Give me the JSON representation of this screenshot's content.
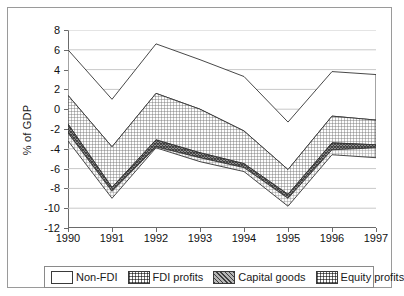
{
  "chart_data": {
    "type": "area",
    "title": "",
    "xlabel": "",
    "ylabel": "% of GDP",
    "categories": [
      "1990",
      "1991",
      "1992",
      "1993",
      "1994",
      "1995",
      "1996",
      "1997"
    ],
    "x": [
      1990,
      1991,
      1992,
      1993,
      1994,
      1995,
      1996,
      1997
    ],
    "ylim": [
      -12,
      8
    ],
    "yticks": [
      8,
      6,
      4,
      2,
      0,
      -2,
      -4,
      -6,
      -8,
      -10,
      -12
    ],
    "ytick_labels": [
      "8",
      "6",
      "4",
      "2",
      "0",
      "-2",
      "-4",
      "-6",
      "-8",
      "-10",
      "-12"
    ],
    "grid": true,
    "legend_position": "bottom",
    "stacked": true,
    "stack_order_top_to_bottom": [
      "Non-FDI",
      "FDI profits",
      "Capital goods",
      "Equity profits"
    ],
    "boundaries": {
      "description": "Cumulative band edges in % of GDP, top edge to bottom edge, per year",
      "non_fdi_top": [
        6.0,
        1.0,
        6.6,
        5.0,
        3.3,
        -1.3,
        3.8,
        3.5
      ],
      "fdi_profits_top": [
        1.4,
        -3.8,
        1.6,
        0.0,
        -2.2,
        -6.1,
        -0.7,
        -1.1
      ],
      "capital_goods_top": [
        -1.5,
        -7.9,
        -3.1,
        -4.4,
        -5.5,
        -8.6,
        -3.4,
        -3.6
      ],
      "equity_profits_top": [
        -2.4,
        -8.3,
        -3.8,
        -4.9,
        -5.9,
        -9.0,
        -4.1,
        -3.9
      ],
      "bottom": [
        -3.2,
        -9.0,
        -3.9,
        -5.3,
        -6.3,
        -9.8,
        -4.6,
        -4.9
      ]
    },
    "series": [
      {
        "name": "Non-FDI",
        "values": [
          4.6,
          4.8,
          5.0,
          5.0,
          5.5,
          4.8,
          4.5,
          4.6
        ]
      },
      {
        "name": "FDI profits",
        "values": [
          2.9,
          4.1,
          4.7,
          4.4,
          3.3,
          2.5,
          2.7,
          2.5
        ]
      },
      {
        "name": "Capital goods",
        "values": [
          0.9,
          0.4,
          0.7,
          0.5,
          0.4,
          0.4,
          0.7,
          0.3
        ]
      },
      {
        "name": "Equity profits",
        "values": [
          0.8,
          0.7,
          0.1,
          0.4,
          0.4,
          0.8,
          0.5,
          1.0
        ]
      }
    ]
  },
  "axis": {
    "y_label": "% of GDP"
  },
  "legend": {
    "items": [
      {
        "label": "Non-FDI",
        "pattern": "solid-white"
      },
      {
        "label": "FDI profits",
        "pattern": "light-grid"
      },
      {
        "label": "Capital goods",
        "pattern": "dark-crosshatch"
      },
      {
        "label": "Equity profits",
        "pattern": "light-grid"
      }
    ]
  }
}
